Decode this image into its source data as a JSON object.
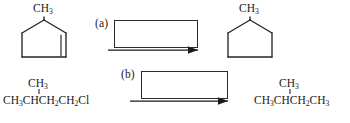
{
  "worksheet": {
    "kind": "organic-chemistry-reaction-scheme",
    "reactions": [
      {
        "id": "a",
        "label": "(a)",
        "reactant": {
          "render": "skeletal",
          "name": "1-methylcyclopentene",
          "substituent_label": "CH",
          "substituent_sub": "3",
          "ring_size": 5,
          "double_bond": true
        },
        "reagent_box": {
          "value": "",
          "placeholder": ""
        },
        "arrow": "right",
        "product": {
          "render": "skeletal",
          "name": "methylcyclopentane",
          "substituent_label": "CH",
          "substituent_sub": "3",
          "ring_size": 5,
          "double_bond": false
        }
      },
      {
        "id": "b",
        "label": "(b)",
        "reactant": {
          "render": "condensed",
          "name": "1-chloro-3-methylbutane",
          "branch_text": "CH3",
          "branch_main": "CH",
          "branch_sub": "3",
          "chain": [
            {
              "t": "CH",
              "s": "3"
            },
            {
              "t": "CH",
              "s": ""
            },
            {
              "t": "CH",
              "s": "2"
            },
            {
              "t": "CH",
              "s": "2"
            },
            {
              "t": "Cl",
              "s": ""
            }
          ]
        },
        "reagent_box": {
          "value": "",
          "placeholder": ""
        },
        "arrow": "right",
        "product": {
          "render": "condensed",
          "name": "2-methylbutane",
          "branch_main": "CH",
          "branch_sub": "3",
          "chain": [
            {
              "t": "CH",
              "s": "3"
            },
            {
              "t": "CH",
              "s": ""
            },
            {
              "t": "CH",
              "s": "2"
            },
            {
              "t": "CH",
              "s": "3"
            }
          ]
        }
      }
    ]
  },
  "colors": {
    "ink": "#242424",
    "paper": "#ffffff"
  }
}
